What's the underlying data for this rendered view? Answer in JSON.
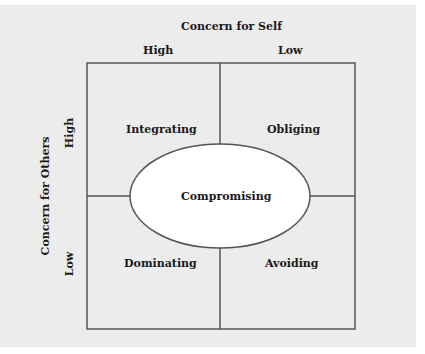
{
  "diagram": {
    "title_top": "Concern for Self",
    "col_labels": [
      "High",
      "Low"
    ],
    "title_left": "Concern for Others",
    "row_labels": [
      "High",
      "Low"
    ],
    "quadrants": {
      "top_left": "Integrating",
      "top_right": "Obliging",
      "bottom_left": "Dominating",
      "bottom_right": "Avoiding"
    },
    "center": "Compromising"
  }
}
